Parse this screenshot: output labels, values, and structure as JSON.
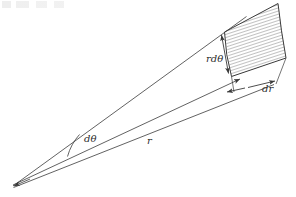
{
  "figure": {
    "kind": "polar-area-element-diagram",
    "width": 296,
    "height": 197,
    "background_color": "#ffffff",
    "line_color": "#3a3a3a",
    "hatch_color": "#555555",
    "label_color": "#2b2b2b",
    "labels": {
      "arc_length": "rdθ",
      "radial_thickness": "dr",
      "angle": "dθ",
      "radius": "r"
    },
    "geometry": {
      "apex": [
        13,
        186
      ],
      "upper_ray_end": [
        246,
        17
      ],
      "lower_ray_end": [
        273,
        84
      ],
      "radius_line_end": [
        243,
        80
      ],
      "angle_arc_radius": 42,
      "element_inner_near": [
        224,
        32
      ],
      "element_inner_far": [
        231,
        76
      ],
      "element_outer_near": [
        277,
        4
      ],
      "element_outer_far": [
        285,
        58
      ]
    }
  }
}
